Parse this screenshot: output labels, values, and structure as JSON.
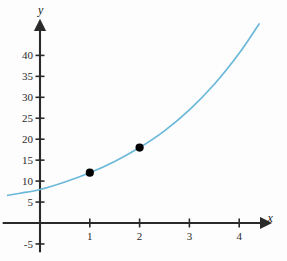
{
  "chart_data": {
    "type": "line",
    "title": "",
    "xlabel": "x",
    "ylabel": "y",
    "xlim": [
      -0.75,
      4.45
    ],
    "ylim": [
      -7,
      46
    ],
    "grid": false,
    "legend": false,
    "curve": {
      "name": "exponential",
      "equation": "y = 8 * 1.5^x",
      "color": "#6bb8d9",
      "x_start": -0.65,
      "x_end": 4.4,
      "points": [
        {
          "x": -0.65,
          "y": 6.6
        },
        {
          "x": -0.4,
          "y": 7.1
        },
        {
          "x": 0.0,
          "y": 8.0
        },
        {
          "x": 0.5,
          "y": 9.8
        },
        {
          "x": 1.0,
          "y": 12.0
        },
        {
          "x": 1.5,
          "y": 14.7
        },
        {
          "x": 2.0,
          "y": 18.0
        },
        {
          "x": 2.5,
          "y": 22.0
        },
        {
          "x": 3.0,
          "y": 27.0
        },
        {
          "x": 3.5,
          "y": 33.1
        },
        {
          "x": 4.0,
          "y": 40.5
        },
        {
          "x": 4.4,
          "y": 47.5
        }
      ]
    },
    "markers": {
      "color": "#000000",
      "values": [
        {
          "x": 1,
          "y": 12
        },
        {
          "x": 2,
          "y": 18
        }
      ]
    },
    "x_ticks": [
      {
        "value": 1,
        "label": "1"
      },
      {
        "value": 2,
        "label": "2"
      },
      {
        "value": 3,
        "label": "3"
      },
      {
        "value": 4,
        "label": "4"
      }
    ],
    "y_ticks": [
      {
        "value": 40,
        "label": "40"
      },
      {
        "value": 35,
        "label": "35"
      },
      {
        "value": 30,
        "label": "30"
      },
      {
        "value": 25,
        "label": "25"
      },
      {
        "value": 20,
        "label": "20"
      },
      {
        "value": 15,
        "label": "15"
      },
      {
        "value": 10,
        "label": "10"
      },
      {
        "value": 5,
        "label": "5"
      },
      {
        "value": -5,
        "label": "-5"
      }
    ],
    "axis_color": "#2a2a2a"
  }
}
